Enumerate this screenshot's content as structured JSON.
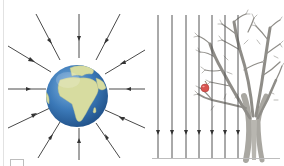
{
  "figure": {
    "left_panel": {
      "subject": "earth-radial-gravitational-field",
      "center": [
        77,
        96
      ],
      "radius": 31,
      "field_line_count": 12,
      "arrow_direction": "inward"
    },
    "right_panel": {
      "subject": "uniform-gravitational-field-near-surface",
      "field_line_count": 7,
      "arrow_direction": "downward",
      "objects": [
        "tree",
        "apple"
      ]
    },
    "colors": {
      "field_line": "#4a4a4a",
      "ocean": "#3b79b8",
      "land": "#d7dca0",
      "apple": "#d9534f",
      "tree": "#9c9a95",
      "ground": "#bdbdbd"
    }
  }
}
